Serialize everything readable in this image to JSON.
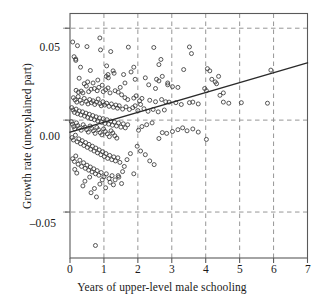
{
  "chart_data": {
    "type": "scatter",
    "title": "",
    "xlabel": "Years of upper-level male schooling",
    "ylabel": "Growth rate (unexplained part)",
    "xlim": [
      0,
      7
    ],
    "ylim": [
      -0.075,
      0.058
    ],
    "xticks": [
      0,
      1,
      2,
      3,
      4,
      5,
      6,
      7
    ],
    "xtick_labels": [
      "0",
      "1",
      "2",
      "3",
      "4",
      "5",
      "6",
      "7"
    ],
    "yticks": [
      0.05,
      0.0,
      -0.05
    ],
    "ytick_labels": [
      "0.05",
      "0.00",
      "–0.05"
    ],
    "grid": true,
    "grid_style": "dashed",
    "grid_color": "#8a8a8a",
    "frame_color": "#5a5a5a",
    "marker": "open-circle",
    "marker_color": "#3a3a3a",
    "marker_size": 3.1,
    "legend": null,
    "series": [
      {
        "name": "countries",
        "points": [
          [
            0.08,
            0.0425
          ],
          [
            0.22,
            0.0405
          ],
          [
            0.5,
            0.04
          ],
          [
            0.88,
            0.0447
          ],
          [
            0.12,
            0.0345
          ],
          [
            0.17,
            0.0332
          ],
          [
            0.17,
            0.0325
          ],
          [
            0.9,
            0.0382
          ],
          [
            1.2,
            0.0373
          ],
          [
            1.72,
            0.0397
          ],
          [
            2.47,
            0.0395
          ],
          [
            3.52,
            0.0398
          ],
          [
            0.31,
            0.0288
          ],
          [
            0.6,
            0.027
          ],
          [
            1.08,
            0.0295
          ],
          [
            1.88,
            0.0288
          ],
          [
            2.62,
            0.0302
          ],
          [
            2.68,
            0.033
          ],
          [
            3.58,
            0.0362
          ],
          [
            3.35,
            0.0275
          ],
          [
            4.05,
            0.028
          ],
          [
            4.12,
            0.0268
          ],
          [
            4.38,
            0.0238
          ],
          [
            5.92,
            0.0272
          ],
          [
            0.27,
            0.0228
          ],
          [
            0.52,
            0.0208
          ],
          [
            1.07,
            0.0238
          ],
          [
            1.12,
            0.0248
          ],
          [
            1.13,
            0.023
          ],
          [
            1.27,
            0.0268
          ],
          [
            1.3,
            0.0255
          ],
          [
            1.58,
            0.0248
          ],
          [
            1.8,
            0.0262
          ],
          [
            2.22,
            0.023
          ],
          [
            2.55,
            0.0222
          ],
          [
            2.62,
            0.0213
          ],
          [
            2.88,
            0.0202
          ],
          [
            4.18,
            0.0222
          ],
          [
            4.28,
            0.0208
          ],
          [
            4.32,
            0.0198
          ],
          [
            3.97,
            0.0172
          ],
          [
            4.02,
            0.016
          ],
          [
            4.52,
            0.0148
          ],
          [
            4.42,
            0.0135
          ],
          [
            0.18,
            0.0162
          ],
          [
            0.25,
            0.0152
          ],
          [
            0.33,
            0.0158
          ],
          [
            0.38,
            0.0148
          ],
          [
            0.55,
            0.0155
          ],
          [
            0.62,
            0.0168
          ],
          [
            0.72,
            0.0172
          ],
          [
            0.8,
            0.016
          ],
          [
            0.85,
            0.0178
          ],
          [
            0.95,
            0.019
          ],
          [
            0.98,
            0.0155
          ],
          [
            1.05,
            0.0165
          ],
          [
            1.12,
            0.0175
          ],
          [
            1.18,
            0.0148
          ],
          [
            1.33,
            0.016
          ],
          [
            1.42,
            0.0152
          ],
          [
            1.48,
            0.0178
          ],
          [
            1.52,
            0.0138
          ],
          [
            1.62,
            0.0122
          ],
          [
            1.7,
            0.0112
          ],
          [
            1.88,
            0.012
          ],
          [
            1.95,
            0.0132
          ],
          [
            2.05,
            0.0105
          ],
          [
            2.12,
            0.0118
          ],
          [
            2.35,
            0.0108
          ],
          [
            2.52,
            0.01
          ],
          [
            2.7,
            0.0112
          ],
          [
            2.82,
            0.01
          ],
          [
            2.92,
            0.0098
          ],
          [
            3.12,
            0.0095
          ],
          [
            3.28,
            0.0085
          ],
          [
            3.52,
            0.0095
          ],
          [
            3.62,
            0.0098
          ],
          [
            3.78,
            0.0088
          ],
          [
            4.52,
            0.0098
          ],
          [
            4.68,
            0.0092
          ],
          [
            5.05,
            0.0095
          ],
          [
            5.82,
            0.0092
          ],
          [
            0.1,
            0.0122
          ],
          [
            0.15,
            0.011
          ],
          [
            0.2,
            0.0098
          ],
          [
            0.24,
            0.0128
          ],
          [
            0.3,
            0.0108
          ],
          [
            0.35,
            0.0092
          ],
          [
            0.42,
            0.0118
          ],
          [
            0.48,
            0.0102
          ],
          [
            0.53,
            0.0088
          ],
          [
            0.58,
            0.0112
          ],
          [
            0.63,
            0.0095
          ],
          [
            0.68,
            0.0105
          ],
          [
            0.73,
            0.0085
          ],
          [
            0.78,
            0.0098
          ],
          [
            0.83,
            0.0115
          ],
          [
            0.88,
            0.009
          ],
          [
            0.92,
            0.0078
          ],
          [
            0.97,
            0.01
          ],
          [
            1.02,
            0.0082
          ],
          [
            1.08,
            0.0092
          ],
          [
            1.15,
            0.0075
          ],
          [
            1.22,
            0.0088
          ],
          [
            1.28,
            0.007
          ],
          [
            1.35,
            0.0082
          ],
          [
            1.4,
            0.0065
          ],
          [
            1.45,
            0.0078
          ],
          [
            1.55,
            0.006
          ],
          [
            1.65,
            0.0072
          ],
          [
            1.75,
            0.0058
          ],
          [
            1.85,
            0.0068
          ],
          [
            2.0,
            0.0052
          ],
          [
            2.18,
            0.0062
          ],
          [
            2.3,
            0.0048
          ],
          [
            2.45,
            0.0058
          ],
          [
            2.6,
            0.0045
          ],
          [
            2.78,
            0.0055
          ],
          [
            0.05,
            0.0068
          ],
          [
            0.09,
            0.0055
          ],
          [
            0.13,
            0.0042
          ],
          [
            0.18,
            0.006
          ],
          [
            0.22,
            0.0035
          ],
          [
            0.27,
            0.005
          ],
          [
            0.32,
            0.0028
          ],
          [
            0.37,
            0.0045
          ],
          [
            0.43,
            0.0022
          ],
          [
            0.47,
            0.0038
          ],
          [
            0.52,
            0.0015
          ],
          [
            0.57,
            0.0032
          ],
          [
            0.62,
            0.0008
          ],
          [
            0.67,
            0.0025
          ],
          [
            0.72,
            0.0002
          ],
          [
            0.77,
            0.0018
          ],
          [
            0.82,
            -0.0005
          ],
          [
            0.87,
            0.0012
          ],
          [
            0.93,
            -0.0012
          ],
          [
            0.98,
            0.0008
          ],
          [
            1.03,
            -0.0018
          ],
          [
            1.09,
            0.0002
          ],
          [
            1.14,
            -0.0022
          ],
          [
            1.2,
            -0.0005
          ],
          [
            1.25,
            -0.0028
          ],
          [
            1.31,
            -0.001
          ],
          [
            1.37,
            -0.0032
          ],
          [
            1.43,
            -0.0015
          ],
          [
            1.5,
            -0.0038
          ],
          [
            1.57,
            -0.002
          ],
          [
            1.63,
            -0.0042
          ],
          [
            1.7,
            -0.0025
          ],
          [
            0.04,
            -0.0008
          ],
          [
            0.07,
            -0.0022
          ],
          [
            0.11,
            -0.0035
          ],
          [
            0.14,
            -0.0048
          ],
          [
            0.19,
            -0.0015
          ],
          [
            0.23,
            -0.003
          ],
          [
            0.28,
            -0.0042
          ],
          [
            0.33,
            -0.0055
          ],
          [
            0.39,
            -0.0025
          ],
          [
            0.44,
            -0.0038
          ],
          [
            0.49,
            -0.0052
          ],
          [
            0.54,
            -0.0065
          ],
          [
            0.59,
            -0.0032
          ],
          [
            0.64,
            -0.0045
          ],
          [
            0.69,
            -0.0058
          ],
          [
            0.74,
            -0.0072
          ],
          [
            0.79,
            -0.004
          ],
          [
            0.84,
            -0.0052
          ],
          [
            0.89,
            -0.0068
          ],
          [
            0.94,
            -0.008
          ],
          [
            0.99,
            -0.0048
          ],
          [
            1.04,
            -0.0062
          ],
          [
            1.1,
            -0.0075
          ],
          [
            1.16,
            -0.009
          ],
          [
            1.21,
            -0.0058
          ],
          [
            1.26,
            -0.007
          ],
          [
            1.32,
            -0.0085
          ],
          [
            1.38,
            -0.0098
          ],
          [
            0.06,
            -0.0095
          ],
          [
            0.1,
            -0.0108
          ],
          [
            0.16,
            -0.0082
          ],
          [
            0.21,
            -0.0118
          ],
          [
            0.26,
            -0.0102
          ],
          [
            0.31,
            -0.0128
          ],
          [
            0.36,
            -0.0112
          ],
          [
            0.41,
            -0.0138
          ],
          [
            0.46,
            -0.0122
          ],
          [
            0.51,
            -0.0148
          ],
          [
            0.56,
            -0.0132
          ],
          [
            0.61,
            -0.0158
          ],
          [
            0.66,
            -0.0142
          ],
          [
            0.71,
            -0.0168
          ],
          [
            0.76,
            -0.0152
          ],
          [
            0.81,
            -0.0178
          ],
          [
            0.86,
            -0.0162
          ],
          [
            0.91,
            -0.0188
          ],
          [
            0.96,
            -0.0172
          ],
          [
            1.01,
            -0.0198
          ],
          [
            1.06,
            -0.0182
          ],
          [
            1.11,
            -0.0208
          ],
          [
            1.17,
            -0.0192
          ],
          [
            1.23,
            -0.0215
          ],
          [
            1.29,
            -0.02
          ],
          [
            1.34,
            -0.0222
          ],
          [
            1.41,
            -0.0205
          ],
          [
            1.47,
            -0.023
          ],
          [
            0.08,
            -0.021
          ],
          [
            0.13,
            -0.0225
          ],
          [
            0.17,
            -0.0195
          ],
          [
            0.24,
            -0.024
          ],
          [
            0.29,
            -0.0218
          ],
          [
            0.34,
            -0.0252
          ],
          [
            0.4,
            -0.0232
          ],
          [
            0.45,
            -0.0262
          ],
          [
            0.5,
            -0.0245
          ],
          [
            0.55,
            -0.0272
          ],
          [
            0.6,
            -0.0255
          ],
          [
            0.65,
            -0.0282
          ],
          [
            0.7,
            -0.0265
          ],
          [
            0.75,
            -0.0292
          ],
          [
            0.8,
            -0.0275
          ],
          [
            0.85,
            -0.03
          ],
          [
            0.92,
            -0.0285
          ],
          [
            1.0,
            -0.0308
          ],
          [
            1.07,
            -0.0292
          ],
          [
            1.15,
            -0.0318
          ],
          [
            1.24,
            -0.0302
          ],
          [
            1.33,
            -0.0325
          ],
          [
            1.44,
            -0.031
          ],
          [
            1.55,
            -0.028
          ],
          [
            1.52,
            -0.0345
          ],
          [
            1.6,
            -0.0252
          ],
          [
            1.68,
            -0.0215
          ],
          [
            1.78,
            -0.0182
          ],
          [
            1.88,
            -0.0292
          ],
          [
            1.98,
            -0.0142
          ],
          [
            2.08,
            -0.0168
          ],
          [
            2.22,
            -0.0188
          ],
          [
            2.35,
            -0.0222
          ],
          [
            2.48,
            -0.0242
          ],
          [
            2.62,
            -0.01
          ],
          [
            2.72,
            -0.0068
          ],
          [
            2.85,
            -0.0072
          ],
          [
            3.02,
            -0.0062
          ],
          [
            3.18,
            -0.0052
          ],
          [
            3.32,
            -0.0042
          ],
          [
            3.45,
            -0.0058
          ],
          [
            3.62,
            -0.0048
          ],
          [
            3.78,
            -0.0065
          ],
          [
            4.02,
            -0.0105
          ],
          [
            0.14,
            -0.0268
          ],
          [
            0.2,
            -0.0288
          ],
          [
            0.38,
            -0.0358
          ],
          [
            0.44,
            -0.0332
          ],
          [
            0.58,
            -0.031
          ],
          [
            0.62,
            -0.0395
          ],
          [
            0.72,
            -0.0372
          ],
          [
            0.78,
            -0.0418
          ],
          [
            0.88,
            -0.0348
          ],
          [
            0.95,
            -0.0325
          ],
          [
            1.05,
            -0.0368
          ],
          [
            1.18,
            -0.0338
          ],
          [
            1.28,
            -0.0352
          ],
          [
            1.42,
            -0.0302
          ],
          [
            0.75,
            -0.0682
          ],
          [
            2.02,
            -0.0055
          ],
          [
            2.12,
            -0.0035
          ],
          [
            2.26,
            -0.0025
          ],
          [
            2.42,
            -0.0015
          ],
          [
            1.92,
            0.0078
          ],
          [
            2.08,
            0.0085
          ],
          [
            0.42,
            0.0198
          ],
          [
            0.48,
            0.0185
          ],
          [
            0.68,
            0.0202
          ],
          [
            0.82,
            0.0218
          ],
          [
            1.62,
            0.0202
          ],
          [
            1.92,
            0.0222
          ],
          [
            2.32,
            0.0192
          ],
          [
            2.52,
            0.0172
          ],
          [
            2.72,
            0.0238
          ],
          [
            2.88,
            0.0192
          ],
          [
            3.02,
            0.0182
          ],
          [
            3.18,
            0.0178
          ]
        ]
      }
    ],
    "regression_line": {
      "x0": 0.0,
      "y0": -0.0065,
      "x1": 7.0,
      "y1": 0.0312,
      "color": "#2a2a2a",
      "width": 1.3
    }
  }
}
